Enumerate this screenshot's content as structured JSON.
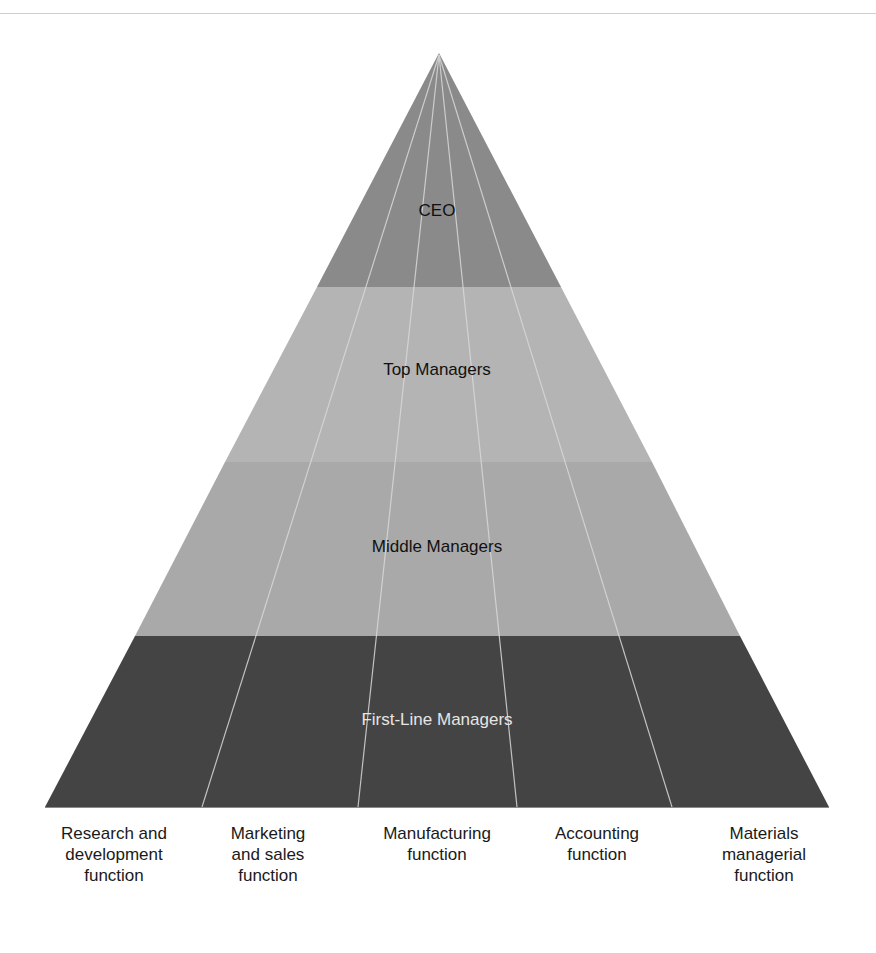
{
  "diagram": {
    "type": "pyramid",
    "levels": [
      {
        "label": "CEO",
        "color": "#8a8a8a",
        "text_color": "#111111"
      },
      {
        "label": "Top Managers",
        "color": "#b4b4b4",
        "text_color": "#111111"
      },
      {
        "label": "Middle Managers",
        "color": "#a9a9a9",
        "text_color": "#111111"
      },
      {
        "label": "First-Line Managers",
        "color": "#444444",
        "text_color": "#e6e6e6"
      }
    ],
    "functions": [
      {
        "label": "Research and\ndevelopment\nfunction"
      },
      {
        "label": "Marketing\nand sales\nfunction"
      },
      {
        "label": "Manufacturing\nfunction"
      },
      {
        "label": "Accounting\nfunction"
      },
      {
        "label": "Materials\nmanagerial\nfunction"
      }
    ],
    "divider_color": "#d9d9d9"
  }
}
